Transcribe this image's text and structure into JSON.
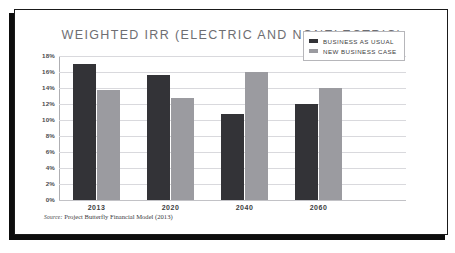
{
  "slide": {
    "title": "WEIGHTED IRR (ELECTRIC AND NONELECTRIC)",
    "source_prefix": "Source:",
    "source_text": "Project Butterfly Financial Model (2013)"
  },
  "legend": {
    "items": [
      {
        "label": "BUSINESS AS USUAL",
        "color": "#333337"
      },
      {
        "label": "NEW BUSINESS CASE",
        "color": "#9b9ba0"
      }
    ]
  },
  "axis": {
    "y_ticks": [
      "18%",
      "16%",
      "14%",
      "12%",
      "10%",
      "8%",
      "6%",
      "4%",
      "2%",
      "0%"
    ],
    "x_labels": [
      "2013",
      "2020",
      "2040",
      "2060"
    ]
  },
  "chart_data": {
    "type": "bar",
    "title": "WEIGHTED IRR (ELECTRIC AND NONELECTRIC)",
    "xlabel": "",
    "ylabel": "",
    "ylim": [
      0,
      18
    ],
    "ytick_values": [
      18,
      16,
      14,
      12,
      10,
      8,
      6,
      4,
      2,
      0
    ],
    "ytick_labels": [
      "18%",
      "16%",
      "14%",
      "12%",
      "10%",
      "8%",
      "6%",
      "4%",
      "2%",
      "0%"
    ],
    "y_unit": "percent",
    "grid": true,
    "legend_position": "top-right",
    "categories": [
      "2013",
      "2020",
      "2040",
      "2060"
    ],
    "series": [
      {
        "name": "BUSINESS AS USUAL",
        "color": "#333337",
        "values": [
          17.0,
          15.6,
          10.7,
          12.0
        ]
      },
      {
        "name": "NEW BUSINESS CASE",
        "color": "#9b9ba0",
        "values": [
          13.7,
          12.8,
          16.0,
          14.0
        ]
      }
    ],
    "source": "Source: Project Butterfly Financial Model (2013)"
  }
}
